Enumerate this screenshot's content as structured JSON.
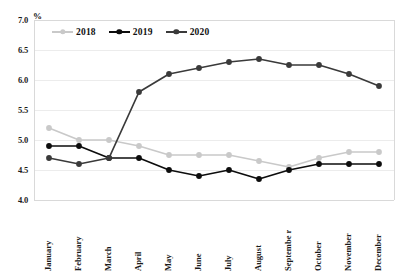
{
  "chart_data": {
    "type": "line",
    "title": "",
    "subtitle": "",
    "xlabel": "",
    "ylabel": "%",
    "ylim": [
      4.0,
      7.0
    ],
    "ytick_step": 0.5,
    "yticks": [
      "7.0",
      "6.5",
      "6.0",
      "5.5",
      "5.0",
      "4.5",
      "4.0"
    ],
    "grid": true,
    "grid_axis": "y",
    "legend_position": "top-left-inside",
    "categories": [
      "January",
      "February",
      "March",
      "April",
      "May",
      "June",
      "July",
      "August",
      "Septembe r",
      "October",
      "November",
      "December"
    ],
    "series": [
      {
        "name": "2018",
        "color": "#c9c9c9",
        "marker": "circle",
        "values": [
          5.2,
          5.0,
          5.0,
          4.9,
          4.75,
          4.75,
          4.75,
          4.65,
          4.55,
          4.7,
          4.8,
          4.8
        ]
      },
      {
        "name": "2019",
        "color": "#0d0d0d",
        "marker": "circle",
        "values": [
          4.9,
          4.9,
          4.7,
          4.7,
          4.5,
          4.4,
          4.5,
          4.35,
          4.5,
          4.6,
          4.6,
          4.6
        ]
      },
      {
        "name": "2020",
        "color": "#3a3a3a",
        "marker": "circle",
        "values": [
          4.7,
          4.6,
          4.7,
          5.8,
          6.1,
          6.2,
          6.3,
          6.35,
          6.25,
          6.25,
          6.1,
          5.9
        ]
      }
    ]
  },
  "plot": {
    "left": 34,
    "top": 20,
    "right": 394,
    "bottom": 200,
    "background": "#ffffff",
    "border_color": "#d9d9d9",
    "grid_color": "#ececec"
  }
}
